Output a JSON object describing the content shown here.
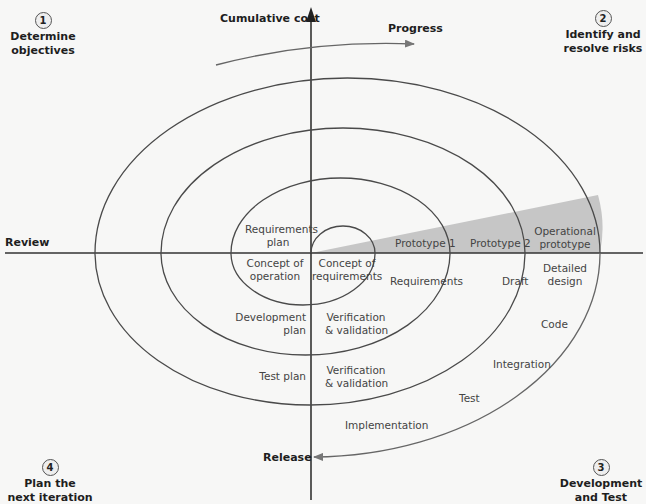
{
  "colors": {
    "line": "#3a3a3a",
    "shade": "#c8c8c8",
    "background": "#f7f7f6"
  },
  "axes": {
    "vertical_label": "Cumulative cost",
    "horizontal_label": "Review",
    "progress_label": "Progress",
    "release_label": "Release"
  },
  "quadrants": [
    {
      "number": "1",
      "line1": "Determine",
      "line2": "objectives"
    },
    {
      "number": "2",
      "line1": "Identify and",
      "line2": "resolve risks"
    },
    {
      "number": "3",
      "line1": "Development",
      "line2": "and Test"
    },
    {
      "number": "4",
      "line1": "Plan the",
      "line2": "next iteration"
    }
  ],
  "prototypes": [
    {
      "line1": "Prototype 1"
    },
    {
      "line1": "Prototype 2"
    },
    {
      "line1": "Operational",
      "line2": "prototype"
    }
  ],
  "labels": {
    "requirements_plan": {
      "line1": "Requirements",
      "line2": "plan"
    },
    "concept_of_operation": {
      "line1": "Concept of",
      "line2": "operation"
    },
    "concept_of_requirements": {
      "line1": "Concept of",
      "line2": "requirements"
    },
    "requirements": "Requirements",
    "draft": "Draft",
    "detailed_design": {
      "line1": "Detailed",
      "line2": "design"
    },
    "code": "Code",
    "integration": "Integration",
    "test": "Test",
    "implementation": "Implementation",
    "development_plan": {
      "line1": "Development",
      "line2": "plan"
    },
    "vv1": {
      "line1": "Verification",
      "line2": "& validation"
    },
    "test_plan": "Test plan",
    "vv2": {
      "line1": "Verification",
      "line2": "& validation"
    }
  }
}
